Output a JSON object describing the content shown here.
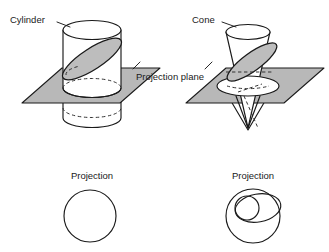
{
  "figure": {
    "width": 329,
    "height": 252,
    "background_color": "#ffffff",
    "line_color": "#1a1a1a",
    "plane_fill_color": "#b8b8b8",
    "cut_section_fill_color": "#bdbdbd",
    "solid_fill_color": "#ffffff"
  },
  "labels": {
    "cylinder": "Cylinder",
    "cone": "Cone",
    "projection_plane": "Projection plane",
    "projection_left": "Projection",
    "projection_right": "Projection"
  },
  "panels": {
    "top_left": {
      "name": "cylinder-cut-by-plane",
      "solid": "cylinder",
      "label": "Cylinder",
      "cut_section_shape": "ellipse",
      "plane": "projection plane"
    },
    "top_right": {
      "name": "cone-cut-by-plane",
      "solid": "cone",
      "label": "Cone",
      "cut_section_shape": "ellipse",
      "plane": "projection plane"
    },
    "bottom_left": {
      "name": "cylinder-projection",
      "label": "Projection",
      "shapes": [
        "circle"
      ]
    },
    "bottom_right": {
      "name": "cone-projection",
      "label": "Projection",
      "shapes": [
        "outer circle",
        "inner ellipse",
        "small circle"
      ]
    }
  }
}
